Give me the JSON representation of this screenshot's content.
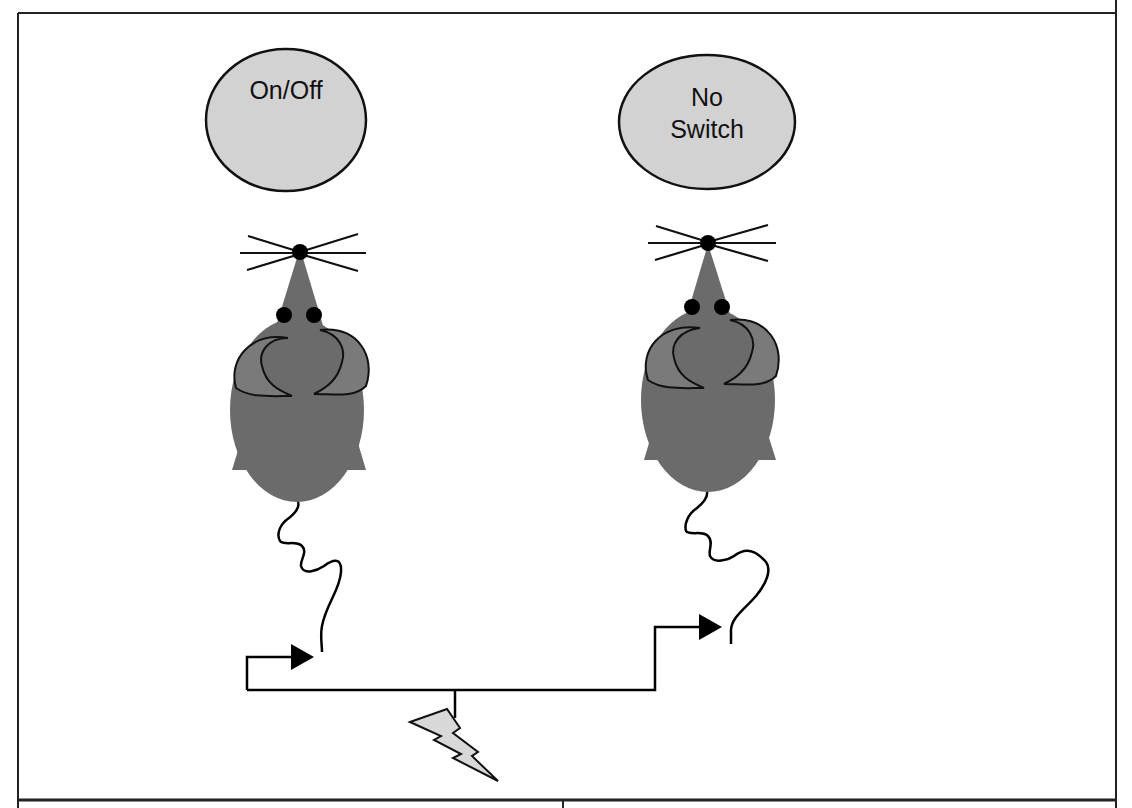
{
  "diagram": {
    "type": "experimental-setup-schematic",
    "colors": {
      "background": "#ffffff",
      "frame": "#222222",
      "label_fill": "#d2d2d2",
      "mouse_body": "#6b6b6b",
      "mouse_ear": "#7a7a7a",
      "eye": "#000000",
      "wire": "#000000",
      "bolt_fill": "#d8d8d8"
    },
    "left_panel": {
      "label": "On/Off",
      "label_shape": "circle",
      "subject": "mouse"
    },
    "right_panel": {
      "label_line1": "No",
      "label_line2": "Switch",
      "label_shape": "ellipse",
      "subject": "mouse"
    },
    "source": {
      "icon": "lightning-bolt-icon",
      "meaning": "shock-source"
    },
    "connections": [
      {
        "from": "source",
        "to": "left_panel.tail",
        "arrow": "arrowhead-right"
      },
      {
        "from": "source",
        "to": "right_panel.tail",
        "arrow": "arrowhead-right"
      }
    ],
    "footer_table": {
      "columns": 2,
      "cells": [
        "",
        ""
      ]
    }
  }
}
